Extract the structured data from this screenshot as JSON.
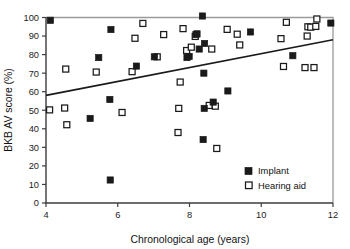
{
  "figure": {
    "background_color": "#ffffff",
    "ink_color": "#1a1a1a",
    "frame_color": "#9a9a9a"
  },
  "chart_data": {
    "type": "scatter",
    "title": "",
    "xlabel": "Chronological age (years)",
    "ylabel": "BKB AV score (%)",
    "xlim": [
      4,
      12
    ],
    "ylim": [
      0,
      100
    ],
    "xticks": [
      4,
      6,
      8,
      10,
      12
    ],
    "yticks": [
      0,
      10,
      20,
      30,
      40,
      50,
      60,
      70,
      80,
      90,
      100
    ],
    "xtick_labels": [
      "4",
      "6",
      "8",
      "10",
      "12"
    ],
    "ytick_labels": [
      "0",
      "10",
      "20",
      "30",
      "40",
      "50",
      "60",
      "70",
      "80",
      "90",
      "100"
    ],
    "grid": false,
    "legend_position": "lower-right",
    "legend": [
      {
        "name": "Implant",
        "marker": "filled-square",
        "color": "#1a1a1a"
      },
      {
        "name": "Hearing aid",
        "marker": "open-square",
        "color": "#1a1a1a"
      }
    ],
    "trend_line": {
      "label": "regression line",
      "x": [
        4.0,
        12.0
      ],
      "y": [
        58.0,
        88.0
      ]
    },
    "series": [
      {
        "name": "Implant",
        "marker": "filled-square",
        "points": [
          [
            4.12,
            98.5
          ],
          [
            5.23,
            45.6
          ],
          [
            5.47,
            78.4
          ],
          [
            5.78,
            55.8
          ],
          [
            5.79,
            12.4
          ],
          [
            5.81,
            93.5
          ],
          [
            6.52,
            73.8
          ],
          [
            7.02,
            78.8
          ],
          [
            7.93,
            78.4
          ],
          [
            7.99,
            79.0
          ],
          [
            8.18,
            90.8
          ],
          [
            8.21,
            91.2
          ],
          [
            8.27,
            83.0
          ],
          [
            8.36,
            100.8
          ],
          [
            8.38,
            34.2
          ],
          [
            8.4,
            70.0
          ],
          [
            8.41,
            51.0
          ],
          [
            8.42,
            86.0
          ],
          [
            8.66,
            54.4
          ],
          [
            9.07,
            60.4
          ],
          [
            9.7,
            92.2
          ],
          [
            10.88,
            79.4
          ],
          [
            11.94,
            97.0
          ]
        ]
      },
      {
        "name": "Hearing aid",
        "marker": "open-square",
        "points": [
          [
            4.1,
            50.2
          ],
          [
            4.52,
            51.2
          ],
          [
            4.55,
            72.2
          ],
          [
            4.58,
            42.2
          ],
          [
            5.4,
            70.6
          ],
          [
            6.12,
            48.8
          ],
          [
            6.4,
            70.8
          ],
          [
            6.48,
            88.8
          ],
          [
            6.7,
            96.8
          ],
          [
            7.1,
            78.8
          ],
          [
            7.28,
            90.8
          ],
          [
            7.68,
            38.0
          ],
          [
            7.7,
            51.0
          ],
          [
            7.74,
            65.2
          ],
          [
            7.82,
            94.0
          ],
          [
            7.92,
            82.2
          ],
          [
            8.05,
            84.0
          ],
          [
            8.16,
            89.8
          ],
          [
            8.55,
            52.6
          ],
          [
            8.62,
            83.0
          ],
          [
            8.72,
            52.2
          ],
          [
            8.76,
            29.4
          ],
          [
            9.05,
            93.6
          ],
          [
            9.33,
            91.0
          ],
          [
            9.4,
            85.2
          ],
          [
            10.55,
            88.6
          ],
          [
            10.62,
            73.6
          ],
          [
            10.7,
            97.4
          ],
          [
            11.22,
            73.0
          ],
          [
            11.28,
            90.0
          ],
          [
            11.3,
            95.0
          ],
          [
            11.38,
            94.8
          ],
          [
            11.47,
            73.0
          ],
          [
            11.52,
            95.2
          ],
          [
            11.55,
            99.2
          ]
        ]
      }
    ]
  }
}
